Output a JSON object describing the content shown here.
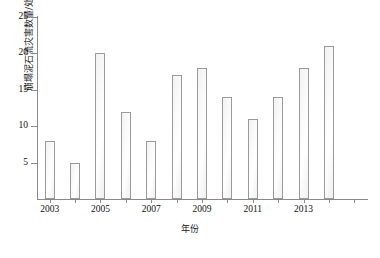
{
  "chart_data": {
    "type": "bar",
    "title": "",
    "xlabel": "年份",
    "ylabel": "崩塌泥石流灾害数量/处",
    "categories": [
      "2003",
      "2004",
      "2005",
      "2006",
      "2007",
      "2008",
      "2009",
      "2010",
      "2011",
      "2012",
      "2013",
      "2014",
      "2015"
    ],
    "values": [
      8,
      5,
      20,
      12,
      8,
      17,
      18,
      14,
      11,
      14,
      18,
      21,
      0
    ],
    "ylim": [
      0,
      25
    ],
    "yticks": [
      0,
      5,
      10,
      15,
      20,
      25
    ],
    "ytick_labels": [
      "",
      "5",
      "10",
      "15",
      "20",
      "25"
    ],
    "xtick_labels_shown": [
      "2003",
      "2005",
      "2007",
      "2009",
      "2011",
      "2013"
    ],
    "grid": false,
    "legend": false,
    "bar_face_color": "#fafafa",
    "bar_edge_color": "#9a9a9a",
    "axis_color": "#8a8a8a"
  },
  "axis": {
    "y_title": "崩塌泥石流灾害数量/处",
    "x_title": "年份"
  }
}
